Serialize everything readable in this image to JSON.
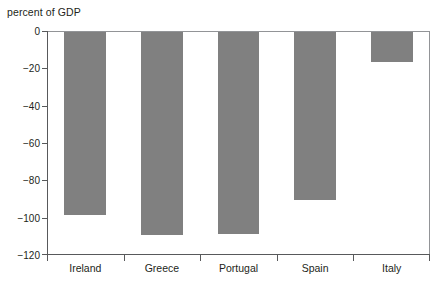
{
  "chart_data": {
    "type": "bar",
    "title": "",
    "ylabel": "percent of GDP",
    "xlabel": "",
    "categories": [
      "Ireland",
      "Greece",
      "Portugal",
      "Spain",
      "Italy"
    ],
    "values": [
      -98,
      -109,
      -108,
      -90,
      -16
    ],
    "ylim": [
      -120,
      0
    ],
    "yticks": [
      0,
      -20,
      -40,
      -60,
      -80,
      -100,
      -120
    ],
    "ytick_labels": [
      "0",
      "−20",
      "−40",
      "−60",
      "−80",
      "−100",
      "−120"
    ],
    "grid": false,
    "legend": null,
    "bar_color": "#808080",
    "axis_color": "#58595b",
    "orientation": "vertical",
    "bars_hang_from_zero": true
  },
  "axis": {
    "ylabel_text": "percent of GDP"
  },
  "series": {
    "points": [
      {
        "category": "Ireland",
        "value": -98
      },
      {
        "category": "Greece",
        "value": -109
      },
      {
        "category": "Portugal",
        "value": -108
      },
      {
        "category": "Spain",
        "value": -90
      },
      {
        "category": "Italy",
        "value": -16
      }
    ]
  }
}
